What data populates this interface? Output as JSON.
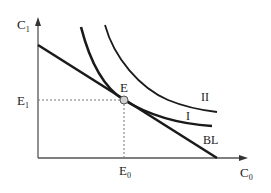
{
  "diagram": {
    "type": "indifference-curve-budget-line",
    "colors": {
      "axis": "#555555",
      "curve": "#1a1a1a",
      "guide": "#777777",
      "point_fill": "#cfcfcf",
      "point_stroke": "#555555",
      "text": "#222222"
    },
    "axes": {
      "y_label": "C",
      "y_sub": "1",
      "x_label": "C",
      "x_sub": "0"
    },
    "point": {
      "label": "E",
      "x_label": "E",
      "x_sub": "0",
      "y_label": "E",
      "y_sub": "1"
    },
    "curves": [
      {
        "id": "indifference-curve-1",
        "label": "I"
      },
      {
        "id": "indifference-curve-2",
        "label": "II"
      },
      {
        "id": "budget-line",
        "label": "BL"
      }
    ]
  }
}
